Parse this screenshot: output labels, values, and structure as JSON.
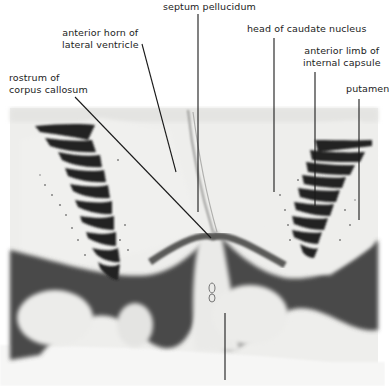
{
  "figure": {
    "type": "labeled anatomical photograph (coronal brain section)",
    "labels": [
      {
        "id": "septum-pellucidum",
        "text": "septum pellucidum"
      },
      {
        "id": "anterior-horn",
        "text": "anterior horn of\nlateral ventricle"
      },
      {
        "id": "head-caudate",
        "text": "head of caudate nucleus"
      },
      {
        "id": "anterior-limb",
        "text": "anterior limb of\ninternal capsule"
      },
      {
        "id": "rostrum",
        "text": "rostrum of\ncorpus callosum"
      },
      {
        "id": "putamen",
        "text": "putamen"
      },
      {
        "id": "bottom-label",
        "text": ""
      }
    ],
    "colors": {
      "background": "#ffffff",
      "tissue_light": "#e9e9e7",
      "tissue_mid": "#c9c9c7",
      "tissue_dark": "#3a3a3a",
      "leader_line": "#1a1a1a"
    }
  }
}
